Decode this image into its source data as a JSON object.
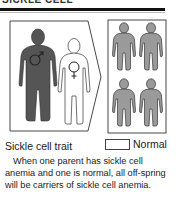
{
  "header": {
    "title": "SICKLE CELL",
    "rule_color": "#111111"
  },
  "diagram": {
    "parents": [
      {
        "label": "affected-parent",
        "symbol": "male",
        "fill": "#555555"
      },
      {
        "label": "normal-parent",
        "symbol": "female",
        "fill": "#ffffff"
      }
    ],
    "offspring": {
      "count": 4,
      "fill": "#9a9a9a"
    }
  },
  "legend": {
    "trait_label": "Sickle cell trait",
    "normal_label": "Normal",
    "normal_swatch_color": "#ffffff"
  },
  "caption": {
    "text": "When one parent has sickle cell anemia and one is normal, all off-spring will be carriers of sickle cell anemia."
  }
}
